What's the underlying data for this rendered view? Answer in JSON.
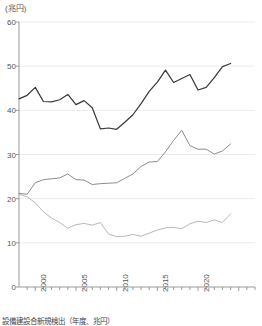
{
  "chart": {
    "unit_label": "(兆円)",
    "caption": "設備建設合新規検出（年度、兆円）",
    "y_ticks": [
      "0",
      "10",
      "20",
      "30",
      "40",
      "50",
      "60"
    ],
    "x_ticks": [
      "2000",
      "2005",
      "2010",
      "2015",
      "2020"
    ],
    "colors": {
      "series_top": "#3a3a3a",
      "series_mid": "#8c8c8c",
      "series_bottom": "#b8b8b8",
      "axis": "#9a9a9a",
      "grid": "#ebebeb",
      "background": "#ffffff"
    }
  },
  "chart_data": {
    "type": "line",
    "title": "",
    "subtitle": "",
    "xlabel": "年度",
    "ylabel": "兆円",
    "xlim": [
      1998,
      2027
    ],
    "ylim": [
      0,
      60
    ],
    "grid": true,
    "legend_position": "none",
    "x": [
      1998,
      1999,
      2000,
      2001,
      2002,
      2003,
      2004,
      2005,
      2006,
      2007,
      2008,
      2009,
      2010,
      2011,
      2012,
      2013,
      2014,
      2015,
      2016,
      2017,
      2018,
      2019,
      2020,
      2021,
      2022,
      2023,
      2024,
      2025,
      2026,
      2027
    ],
    "x_tick_labels": [
      "2000",
      "2005",
      "2010",
      "2015",
      "2020"
    ],
    "y_tick_values": [
      0,
      10,
      20,
      30,
      40,
      50,
      60
    ],
    "series": [
      {
        "name": "系列1",
        "color": "#3a3a3a",
        "values": [
          42.6,
          43.4,
          45.2,
          42.0,
          41.9,
          42.4,
          43.6,
          41.3,
          42.2,
          40.6,
          35.8,
          36.0,
          35.7,
          37.3,
          39.0,
          41.5,
          44.3,
          46.4,
          49.1,
          46.3,
          47.2,
          48.1,
          44.6,
          45.2,
          47.4,
          49.9,
          50.6,
          null,
          null,
          null
        ]
      },
      {
        "name": "系列2",
        "color": "#8c8c8c",
        "values": [
          21.2,
          21.0,
          23.6,
          24.3,
          24.5,
          24.7,
          25.6,
          24.3,
          24.2,
          23.2,
          23.4,
          23.5,
          23.6,
          24.6,
          25.6,
          27.3,
          28.3,
          28.4,
          30.6,
          33.2,
          35.5,
          32.0,
          31.2,
          31.2,
          30.1,
          30.8,
          32.4,
          null,
          null,
          null
        ]
      },
      {
        "name": "系列3",
        "color": "#b8b8b8",
        "values": [
          21.0,
          20.4,
          19.1,
          17.0,
          15.6,
          14.6,
          13.3,
          14.1,
          14.4,
          14.0,
          14.6,
          12.0,
          11.4,
          11.5,
          11.9,
          11.5,
          12.2,
          12.9,
          13.4,
          13.5,
          13.2,
          14.3,
          14.9,
          14.6,
          15.2,
          14.6,
          16.6,
          null,
          null,
          null
        ]
      }
    ]
  }
}
